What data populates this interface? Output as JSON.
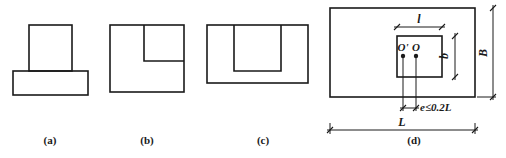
{
  "figure": {
    "panels": [
      {
        "id": "a",
        "label": "(a)",
        "description": "T-shaped: narrow column rectangle standing on a wider base rectangle"
      },
      {
        "id": "b",
        "label": "(b)",
        "description": "Square with smaller rectangle inset at upper-right corner"
      },
      {
        "id": "c",
        "label": "(c)",
        "description": "Rectangle with inner rectangle attached to top edge"
      },
      {
        "id": "d",
        "label": "(d)",
        "description": "Plan view of foundation L×B with column l×b, eccentricity e between centroids O' and O"
      }
    ],
    "panel_d": {
      "dim_column_length": "l",
      "dim_column_width": "b",
      "dim_foundation_width": "B",
      "dim_foundation_length": "L",
      "point_column_center": "O'",
      "point_foundation_center": "O",
      "eccentricity_label": "e≤0.2L"
    }
  }
}
